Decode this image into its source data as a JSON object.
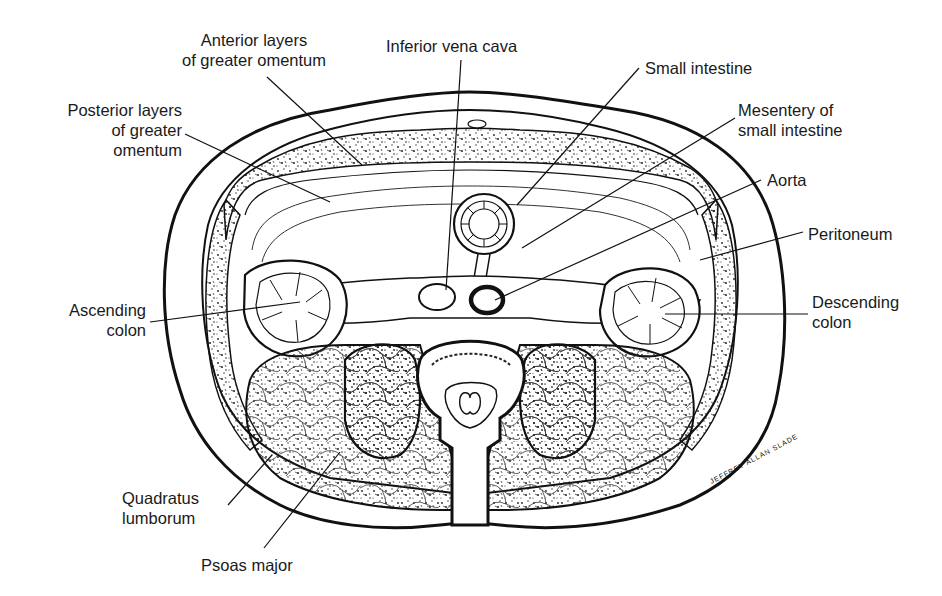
{
  "figure": {
    "signature": "JEFFREY ALLAN SLADE"
  },
  "labels": {
    "anterior_layers": [
      "Anterior layers",
      "of greater omentum"
    ],
    "inferior_vena_cava": "Inferior vena cava",
    "small_intestine": "Small intestine",
    "posterior_layers": [
      "Posterior layers",
      "of greater",
      "omentum"
    ],
    "mesentery": [
      "Mesentery of",
      "small intestine"
    ],
    "aorta": "Aorta",
    "peritoneum": "Peritoneum",
    "ascending_colon": [
      "Ascending",
      "colon"
    ],
    "descending_colon": [
      "Descending",
      "colon"
    ],
    "quadratus_lumborum": [
      "Quadratus",
      "lumborum"
    ],
    "psoas_major": "Psoas major"
  },
  "colors": {
    "ink": "#111111",
    "background": "#ffffff",
    "label_text": "#1a1a1a"
  }
}
